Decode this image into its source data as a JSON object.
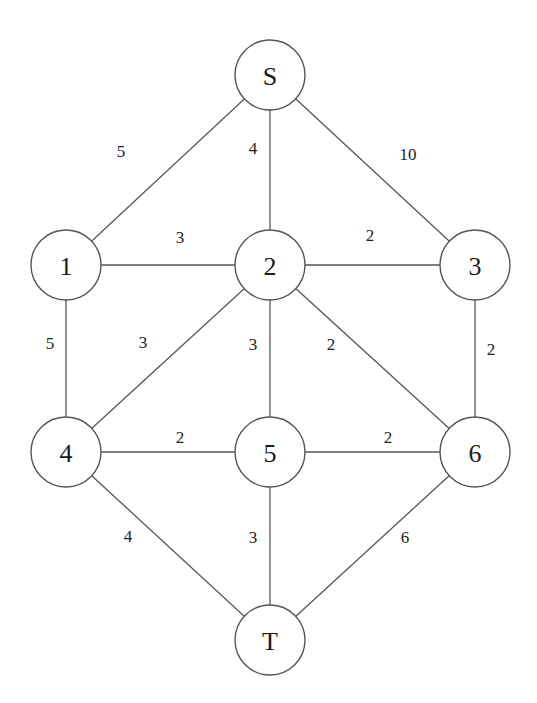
{
  "diagram": {
    "type": "weighted-undirected-graph",
    "nodes": [
      {
        "id": "S",
        "label": "S",
        "x": 270,
        "y": 75
      },
      {
        "id": "1",
        "label": "1",
        "x": 66,
        "y": 265
      },
      {
        "id": "2",
        "label": "2",
        "x": 270,
        "y": 265
      },
      {
        "id": "3",
        "label": "3",
        "x": 475,
        "y": 265
      },
      {
        "id": "4",
        "label": "4",
        "x": 66,
        "y": 452
      },
      {
        "id": "5",
        "label": "5",
        "x": 270,
        "y": 452
      },
      {
        "id": "6",
        "label": "6",
        "x": 475,
        "y": 452
      },
      {
        "id": "T",
        "label": "T",
        "x": 270,
        "y": 640
      }
    ],
    "edges": [
      {
        "from": "S",
        "to": "1",
        "weight": "5",
        "lx": 121,
        "ly": 151
      },
      {
        "from": "S",
        "to": "2",
        "weight": "4",
        "lx": 253,
        "ly": 148
      },
      {
        "from": "S",
        "to": "3",
        "weight": "10",
        "lx": 408,
        "ly": 154
      },
      {
        "from": "1",
        "to": "2",
        "weight": "3",
        "lx": 180,
        "ly": 237
      },
      {
        "from": "2",
        "to": "3",
        "weight": "2",
        "lx": 370,
        "ly": 235
      },
      {
        "from": "1",
        "to": "4",
        "weight": "5",
        "lx": 50,
        "ly": 343
      },
      {
        "from": "2",
        "to": "4",
        "weight": "3",
        "lx": 143,
        "ly": 342
      },
      {
        "from": "2",
        "to": "5",
        "weight": "3",
        "lx": 253,
        "ly": 344
      },
      {
        "from": "2",
        "to": "6",
        "weight": "2",
        "lx": 331,
        "ly": 344
      },
      {
        "from": "3",
        "to": "6",
        "weight": "2",
        "lx": 491,
        "ly": 349
      },
      {
        "from": "4",
        "to": "5",
        "weight": "2",
        "lx": 180,
        "ly": 437
      },
      {
        "from": "5",
        "to": "6",
        "weight": "2",
        "lx": 388,
        "ly": 437
      },
      {
        "from": "4",
        "to": "T",
        "weight": "4",
        "lx": 128,
        "ly": 536
      },
      {
        "from": "5",
        "to": "T",
        "weight": "3",
        "lx": 253,
        "ly": 537
      },
      {
        "from": "6",
        "to": "T",
        "weight": "6",
        "lx": 405,
        "ly": 537
      }
    ],
    "node_radius": 35,
    "colors": {
      "stroke": "#555555",
      "text": "#1a1a1a",
      "background": "#ffffff"
    }
  }
}
